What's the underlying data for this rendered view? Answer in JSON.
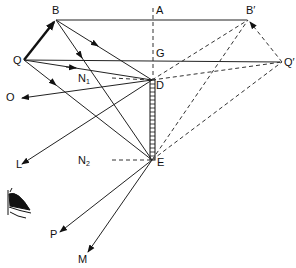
{
  "diagram": {
    "points": {
      "B": {
        "label": "B",
        "x": 56,
        "y": 20
      },
      "A": {
        "label": "A",
        "x": 153,
        "y": 20
      },
      "B_prime": {
        "label": "B′",
        "x": 250,
        "y": 20
      },
      "Q": {
        "label": "Q",
        "x": 24,
        "y": 60
      },
      "G": {
        "label": "G",
        "x": 153,
        "y": 62
      },
      "Q_prime": {
        "label": "Q′",
        "x": 282,
        "y": 62
      },
      "D": {
        "label": "D",
        "x": 152,
        "y": 80
      },
      "E": {
        "label": "E",
        "x": 152,
        "y": 160
      },
      "N1": {
        "label": "N",
        "sub": "1",
        "x": 100,
        "y": 78
      },
      "N2": {
        "label": "N",
        "sub": "2",
        "x": 100,
        "y": 160
      },
      "O": {
        "label": "O",
        "x": 22,
        "y": 97
      },
      "L": {
        "label": "L",
        "x": 24,
        "y": 164
      },
      "P": {
        "label": "P",
        "x": 58,
        "y": 232
      },
      "M": {
        "label": "M",
        "x": 86,
        "y": 256
      }
    },
    "labels": {
      "B": "B",
      "A": "A",
      "B_prime": "B′",
      "Q": "Q",
      "G": "G",
      "Q_prime": "Q′",
      "D": "D",
      "E": "E",
      "N": "N",
      "sub1": "1",
      "sub2": "2",
      "O": "O",
      "L": "L",
      "P": "P",
      "M": "M"
    },
    "elements": {
      "object": "QB (thick arrow)",
      "image": "Q′B′ (dashed arrow)",
      "mirror": "DE (hatched vertical)",
      "normals": [
        "N1–D",
        "N2–E"
      ],
      "observer": "eye-icon"
    }
  }
}
